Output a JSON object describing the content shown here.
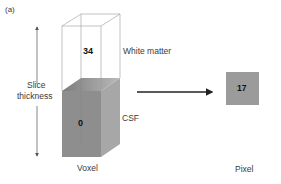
{
  "figure": {
    "panel_label": "(a)"
  },
  "voxel": {
    "caption": "Voxel",
    "upper_value": "34",
    "upper_tissue": "White matter",
    "lower_value": "0",
    "lower_tissue": "CSF",
    "dimension_label_line1": "Slice",
    "dimension_label_line2": "thickness"
  },
  "pixel": {
    "caption": "Pixel",
    "value": "17"
  },
  "colors": {
    "csf_front": "#8f8f8f",
    "csf_side": "#a9a9a9",
    "csf_top": "#b5b5b5",
    "pixel_fill": "#999999",
    "outline": "#9a9a9a",
    "arrow": "#222222"
  }
}
